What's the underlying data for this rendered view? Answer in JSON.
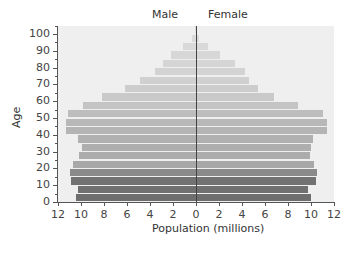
{
  "chart_data": {
    "type": "bar",
    "orientation": "horizontal-pyramid",
    "title": "",
    "left_label": "Male",
    "right_label": "Female",
    "xlabel": "Population (millions)",
    "ylabel": "Age",
    "xlim": [
      -12,
      12
    ],
    "x_tick_labels": [
      "12",
      "10",
      "8",
      "6",
      "4",
      "2",
      "0",
      "2",
      "4",
      "6",
      "8",
      "10",
      "12"
    ],
    "y_tick_labels": [
      "0",
      "10",
      "20",
      "30",
      "40",
      "50",
      "60",
      "70",
      "80",
      "90",
      "100"
    ],
    "ylim": [
      0,
      105
    ],
    "categories": [
      "0-4",
      "5-9",
      "10-14",
      "15-19",
      "20-24",
      "25-29",
      "30-34",
      "35-39",
      "40-44",
      "45-49",
      "50-54",
      "55-59",
      "60-64",
      "65-69",
      "70-74",
      "75-79",
      "80-84",
      "85-89",
      "90-94",
      "95-99",
      "100+"
    ],
    "series": [
      {
        "name": "Male",
        "values": [
          10.4,
          10.3,
          10.9,
          11.0,
          10.7,
          10.2,
          9.9,
          10.3,
          11.3,
          11.3,
          11.1,
          9.8,
          8.2,
          6.2,
          4.9,
          3.6,
          2.9,
          2.2,
          1.1,
          0.35,
          0.05
        ]
      },
      {
        "name": "Female",
        "values": [
          10.0,
          9.7,
          10.4,
          10.5,
          10.3,
          9.9,
          10.0,
          10.2,
          11.4,
          11.4,
          11.0,
          8.9,
          6.8,
          5.4,
          4.6,
          4.3,
          3.4,
          2.1,
          1.0,
          0.3,
          0.05
        ]
      }
    ],
    "band_colors": [
      "#6e6e6e",
      "#707070",
      "#727272",
      "#8a8a8a",
      "#a8a8a8",
      "#acacac",
      "#aeaeae",
      "#b0b0b0",
      "#b4b4b4",
      "#b8b8b8",
      "#bdbdbd",
      "#c4c4c4",
      "#c9c9c9",
      "#cdcdcd",
      "#d0d0d0",
      "#d3d3d3",
      "#d5d5d5",
      "#d7d7d7",
      "#d9d9d9",
      "#dbdbdb",
      "#dddddd"
    ],
    "grid": false,
    "legend": "none"
  }
}
